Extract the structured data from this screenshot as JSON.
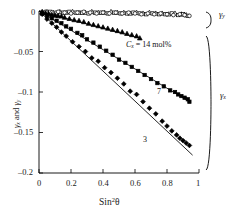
{
  "chart_data": {
    "type": "scatter",
    "title": "",
    "xlabel": "Sin²θ",
    "ylabel": "γx and γy",
    "xlim": [
      0,
      1
    ],
    "ylim": [
      -0.2,
      0
    ],
    "grid": false,
    "legend": "none",
    "xticks": [
      "0",
      "0.2",
      "0.4",
      "0.6",
      "0.8",
      "1"
    ],
    "xtickvals": [
      0,
      0.2,
      0.4,
      0.6,
      0.8,
      1
    ],
    "yticks": [
      "0",
      "–0.05",
      "–0.1",
      "–0.15",
      "–0.2"
    ],
    "ytickvals": [
      0,
      -0.05,
      -0.1,
      -0.15,
      -0.2
    ],
    "annotations": [
      {
        "name": "cx-14-molpercent",
        "text": "Cx = 14 mol%",
        "x": 0.52,
        "y": -0.037
      },
      {
        "name": "series-7-label",
        "text": "7",
        "x": 0.7,
        "y": -0.098
      },
      {
        "name": "series-3-label",
        "text": "3",
        "x": 0.62,
        "y": -0.152
      },
      {
        "name": "gamma-y-bracket-label",
        "text": "γy",
        "x": 1.1,
        "y": -0.009
      },
      {
        "name": "gamma-x-bracket-label",
        "text": "γx",
        "x": 1.12,
        "y": -0.105
      }
    ],
    "series": [
      {
        "name": "gamma_y 14 mol% (open triangles)",
        "marker": "open-triangle",
        "group": "gamma_y",
        "fit_line": null,
        "x": [
          0.02,
          0.05,
          0.09,
          0.13,
          0.17,
          0.21,
          0.25,
          0.29,
          0.33,
          0.37,
          0.41,
          0.45,
          0.49,
          0.53,
          0.57,
          0.61,
          0.65,
          0.69,
          0.73,
          0.77,
          0.81,
          0.85,
          0.89,
          0.92
        ],
        "y": [
          -0.001,
          -0.001,
          -0.002,
          -0.001,
          -0.002,
          -0.001,
          -0.002,
          -0.002,
          -0.001,
          -0.002,
          -0.002,
          -0.001,
          -0.002,
          -0.002,
          -0.003,
          -0.002,
          -0.003,
          -0.002,
          -0.003,
          -0.003,
          -0.004,
          -0.003,
          -0.004,
          -0.005
        ]
      },
      {
        "name": "gamma_y 7 mol% (open squares)",
        "marker": "open-square",
        "group": "gamma_y",
        "fit_line": null,
        "x": [
          0.03,
          0.07,
          0.11,
          0.15,
          0.19,
          0.23,
          0.27,
          0.31,
          0.35,
          0.39,
          0.43,
          0.47,
          0.51,
          0.55,
          0.59,
          0.63,
          0.67,
          0.71,
          0.75,
          0.79,
          0.83,
          0.87,
          0.9,
          0.93
        ],
        "y": [
          -0.002,
          -0.001,
          -0.002,
          -0.002,
          -0.001,
          -0.002,
          -0.002,
          -0.003,
          -0.002,
          -0.002,
          -0.003,
          -0.002,
          -0.003,
          -0.003,
          -0.002,
          -0.003,
          -0.004,
          -0.003,
          -0.004,
          -0.004,
          -0.003,
          -0.005,
          -0.004,
          -0.006
        ]
      },
      {
        "name": "gamma_y 3 mol% (open circles)",
        "marker": "open-circle",
        "group": "gamma_y",
        "fit_line": null,
        "x": [
          0.04,
          0.08,
          0.12,
          0.16,
          0.2,
          0.24,
          0.28,
          0.32,
          0.36,
          0.4,
          0.44,
          0.48,
          0.52,
          0.56,
          0.6,
          0.64,
          0.68,
          0.72,
          0.76,
          0.8,
          0.84,
          0.88,
          0.91,
          0.94
        ],
        "y": [
          -0.001,
          -0.002,
          -0.001,
          -0.002,
          -0.003,
          -0.002,
          -0.001,
          -0.002,
          -0.003,
          -0.002,
          -0.003,
          -0.002,
          -0.003,
          -0.002,
          -0.003,
          -0.004,
          -0.003,
          -0.004,
          -0.003,
          -0.004,
          -0.005,
          -0.004,
          -0.005,
          -0.006
        ]
      },
      {
        "name": "gamma_x 14 mol% (filled triangles)",
        "marker": "filled-triangle",
        "group": "gamma_x",
        "label": "Cx = 14 mol%",
        "fit_line": {
          "x0": 0.0,
          "y0": 0.0,
          "x1": 0.63,
          "y1": -0.0335
        },
        "x": [
          0.02,
          0.04,
          0.06,
          0.08,
          0.1,
          0.12,
          0.14,
          0.16,
          0.19,
          0.22,
          0.25,
          0.28,
          0.31,
          0.34,
          0.37,
          0.4,
          0.43,
          0.46,
          0.49,
          0.52,
          0.55,
          0.58,
          0.61,
          0.63
        ],
        "y": [
          -0.0015,
          -0.0025,
          -0.0035,
          -0.0045,
          -0.0055,
          -0.006,
          -0.0065,
          -0.008,
          -0.0095,
          -0.011,
          -0.012,
          -0.0135,
          -0.0155,
          -0.017,
          -0.0185,
          -0.02,
          -0.0215,
          -0.023,
          -0.0245,
          -0.026,
          -0.028,
          -0.0295,
          -0.031,
          -0.0335
        ]
      },
      {
        "name": "gamma_x 7 mol% (filled squares)",
        "marker": "filled-square",
        "group": "gamma_x",
        "label": "7",
        "fit_line": {
          "x0": 0.0,
          "y0": 0.0,
          "x1": 0.94,
          "y1": -0.112
        },
        "x": [
          0.02,
          0.05,
          0.08,
          0.11,
          0.14,
          0.17,
          0.2,
          0.24,
          0.27,
          0.3,
          0.34,
          0.38,
          0.42,
          0.46,
          0.5,
          0.54,
          0.58,
          0.62,
          0.66,
          0.7,
          0.74,
          0.78,
          0.82,
          0.85,
          0.87,
          0.89,
          0.91,
          0.93,
          0.94
        ],
        "y": [
          -0.003,
          -0.006,
          -0.009,
          -0.012,
          -0.015,
          -0.019,
          -0.022,
          -0.027,
          -0.03,
          -0.035,
          -0.039,
          -0.044,
          -0.049,
          -0.054,
          -0.06,
          -0.064,
          -0.069,
          -0.074,
          -0.079,
          -0.084,
          -0.089,
          -0.093,
          -0.098,
          -0.1,
          -0.103,
          -0.105,
          -0.107,
          -0.109,
          -0.112
        ]
      },
      {
        "name": "gamma_x 3 mol% (filled diamonds)",
        "marker": "filled-diamond",
        "group": "gamma_x",
        "label": "3",
        "fit_line": {
          "x0": 0.0,
          "y0": 0.0,
          "x1": 0.96,
          "y1": -0.178
        },
        "x": [
          0.02,
          0.05,
          0.08,
          0.11,
          0.14,
          0.17,
          0.21,
          0.25,
          0.29,
          0.33,
          0.37,
          0.41,
          0.45,
          0.49,
          0.53,
          0.57,
          0.61,
          0.65,
          0.69,
          0.73,
          0.77,
          0.8,
          0.83,
          0.86,
          0.88,
          0.9,
          0.92,
          0.94
        ],
        "y": [
          -0.004,
          -0.01,
          -0.015,
          -0.02,
          -0.026,
          -0.031,
          -0.038,
          -0.044,
          -0.05,
          -0.058,
          -0.062,
          -0.07,
          -0.076,
          -0.083,
          -0.09,
          -0.099,
          -0.103,
          -0.112,
          -0.12,
          -0.127,
          -0.136,
          -0.142,
          -0.148,
          -0.153,
          -0.157,
          -0.16,
          -0.163,
          -0.166
        ]
      }
    ]
  }
}
